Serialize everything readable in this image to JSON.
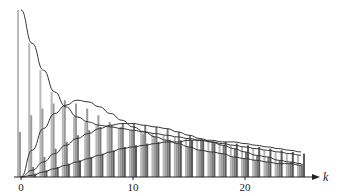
{
  "chart_data": {
    "type": "bar",
    "title": "",
    "xlabel": "k",
    "ylabel": "",
    "x_ticks": [
      "0",
      "10",
      "20"
    ],
    "x_tick_values": [
      0,
      10,
      20
    ],
    "xlim": [
      0,
      25
    ],
    "ylim": [
      0,
      1.0
    ],
    "grid": false,
    "legend": "none",
    "categories": [
      0,
      1,
      2,
      3,
      4,
      5,
      6,
      7,
      8,
      9,
      10,
      11,
      12,
      13,
      14,
      15,
      16,
      17,
      18,
      19,
      20,
      21,
      22,
      23,
      24,
      25
    ],
    "series": [
      {
        "name": "series-1",
        "color": "#b8b8b8",
        "values": [
          1.0,
          0.8,
          0.64,
          0.51,
          0.42,
          0.36,
          0.33,
          0.31,
          0.3,
          0.29,
          0.28,
          0.27,
          0.26,
          0.25,
          0.24,
          0.23,
          0.22,
          0.21,
          0.2,
          0.19,
          0.18,
          0.17,
          0.16,
          0.15,
          0.14,
          0.13
        ]
      },
      {
        "name": "series-2",
        "color": "#9a9a9a",
        "values": [
          0.27,
          0.37,
          0.41,
          0.44,
          0.46,
          0.44,
          0.41,
          0.37,
          0.33,
          0.3,
          0.28,
          0.26,
          0.24,
          0.22,
          0.2,
          0.18,
          0.16,
          0.15,
          0.14,
          0.12,
          0.11,
          0.1,
          0.09,
          0.08,
          0.08,
          0.07
        ]
      },
      {
        "name": "series-3",
        "color": "#7a7a7a",
        "values": [
          0.0,
          0.06,
          0.12,
          0.17,
          0.21,
          0.25,
          0.28,
          0.3,
          0.31,
          0.32,
          0.32,
          0.31,
          0.3,
          0.29,
          0.27,
          0.25,
          0.23,
          0.21,
          0.19,
          0.17,
          0.15,
          0.13,
          0.12,
          0.1,
          0.09,
          0.08
        ]
      },
      {
        "name": "series-4",
        "color": "#5a5a5a",
        "values": [
          0.0,
          0.02,
          0.04,
          0.06,
          0.08,
          0.1,
          0.12,
          0.14,
          0.16,
          0.18,
          0.19,
          0.2,
          0.21,
          0.22,
          0.22,
          0.22,
          0.22,
          0.21,
          0.21,
          0.2,
          0.19,
          0.18,
          0.17,
          0.16,
          0.15,
          0.14
        ]
      }
    ],
    "curves": [
      {
        "name": "curve-1",
        "values": [
          1.0,
          0.8,
          0.64,
          0.51,
          0.42,
          0.36,
          0.33,
          0.31,
          0.3,
          0.29,
          0.28,
          0.27,
          0.26,
          0.25,
          0.24,
          0.23,
          0.22,
          0.21,
          0.2,
          0.19,
          0.18,
          0.17,
          0.16,
          0.15,
          0.14,
          0.13
        ]
      },
      {
        "name": "curve-2",
        "values": [
          0.0,
          0.16,
          0.29,
          0.38,
          0.43,
          0.46,
          0.45,
          0.42,
          0.38,
          0.34,
          0.3,
          0.27,
          0.24,
          0.22,
          0.2,
          0.18,
          0.16,
          0.15,
          0.14,
          0.12,
          0.11,
          0.1,
          0.09,
          0.08,
          0.08,
          0.07
        ]
      },
      {
        "name": "curve-3",
        "values": [
          0.0,
          0.04,
          0.09,
          0.14,
          0.19,
          0.23,
          0.26,
          0.29,
          0.31,
          0.32,
          0.32,
          0.31,
          0.3,
          0.29,
          0.27,
          0.25,
          0.23,
          0.21,
          0.19,
          0.17,
          0.15,
          0.13,
          0.12,
          0.1,
          0.09,
          0.08
        ]
      },
      {
        "name": "curve-4",
        "values": [
          0.0,
          0.01,
          0.03,
          0.05,
          0.07,
          0.09,
          0.11,
          0.13,
          0.15,
          0.17,
          0.18,
          0.19,
          0.2,
          0.21,
          0.21,
          0.22,
          0.22,
          0.22,
          0.21,
          0.21,
          0.2,
          0.19,
          0.18,
          0.17,
          0.16,
          0.15
        ]
      }
    ]
  },
  "axes": {
    "x_label": "k",
    "ticks": [
      {
        "label": "0",
        "value": 0
      },
      {
        "label": "10",
        "value": 10
      },
      {
        "label": "20",
        "value": 20
      }
    ]
  }
}
